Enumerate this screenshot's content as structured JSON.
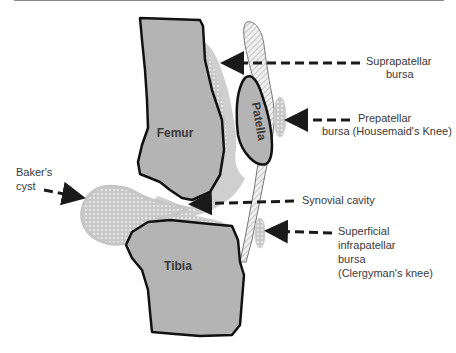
{
  "diagram": {
    "bones": {
      "femur": "Femur",
      "patella": "Patella",
      "tibia": "Tibia"
    },
    "labels": {
      "suprapatellar": {
        "line1": "Suprapatellar",
        "line2": "bursa"
      },
      "prepatellar": {
        "line1": "Prepatellar",
        "line2": "bursa (Housemaid's Knee)"
      },
      "bakers": {
        "line1": "Baker's",
        "line2": "cyst"
      },
      "synovial": {
        "line1": "Synovial cavity"
      },
      "infrapatellar": {
        "line1": "Superficial",
        "line2": "infrapatellar",
        "line3": "bursa",
        "line4": "(Clergyman's knee)"
      }
    },
    "colors": {
      "bone_fill": "#b4b4b4",
      "bone_outline": "#111111",
      "bursa_fill": "#cfcfcf",
      "tendon_fill": "#e6e6e6",
      "arrow": "#1a1a1a",
      "text": "#3a3a3a"
    }
  }
}
